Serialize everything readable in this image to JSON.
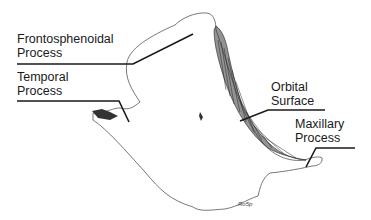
{
  "figure": {
    "signature": "Ro5p",
    "labels": [
      {
        "id": "frontosphenoidal",
        "line1": "Frontosphenoidal",
        "line2": "Process"
      },
      {
        "id": "temporal",
        "line1": "Temporal",
        "line2": "Process"
      },
      {
        "id": "orbital",
        "line1": "Orbital",
        "line2": "Surface"
      },
      {
        "id": "maxillary",
        "line1": "Maxillary",
        "line2": "Process"
      }
    ]
  }
}
